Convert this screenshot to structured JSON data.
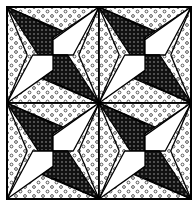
{
  "figure": {
    "frame": {
      "x": 7,
      "y": 7,
      "width": 184,
      "height": 192
    },
    "center": {
      "x": 99,
      "y": 103
    },
    "colors": {
      "outline": "#000000",
      "dark_fill": "#111111",
      "dark_dot": "#bbbbbb",
      "light_fill": "#ffffff",
      "dot_fill": "#ffffff",
      "dot_ring": "#444444"
    },
    "quadrants": [
      {
        "name": "top-left",
        "cx": 53,
        "cy": 55
      },
      {
        "name": "top-right",
        "cx": 145,
        "cy": 55
      },
      {
        "name": "bottom-left",
        "cx": 53,
        "cy": 151
      },
      {
        "name": "bottom-right",
        "cx": 145,
        "cy": 151
      }
    ],
    "pattern_labels": {
      "dark": "dark blade (dotted black)",
      "white": "white kite",
      "dotted": "light dotted background"
    }
  }
}
